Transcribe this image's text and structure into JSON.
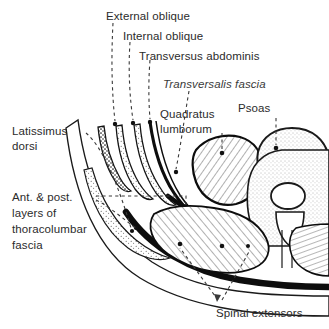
{
  "figure": {
    "type": "anatomical-cross-section-diagram",
    "background_color": "#ffffff",
    "ink_color": "#1a1a1a",
    "text_color": "#2b2b2b",
    "leader_line_style": "dashed",
    "width": 329,
    "height": 329
  },
  "labels": {
    "external_oblique": "External oblique",
    "internal_oblique": "Internal oblique",
    "transversus_abdominis": "Transversus abdominis",
    "transversalis_fascia": "Transversalis fascia",
    "quadratus_lumborum_line1": "Quadratus",
    "quadratus_lumborum_line2": "lumborum",
    "psoas": "Psoas",
    "latissimus_dorsi_line1": "Latissimus",
    "latissimus_dorsi_line2": "dorsi",
    "thoracolumbar_fascia_line1": "Ant. & post.",
    "thoracolumbar_fascia_line2": "layers of",
    "thoracolumbar_fascia_line3": "thoracolumbar",
    "thoracolumbar_fascia_line4": "fascia",
    "spinal_extensors": "Spinal extensors"
  },
  "structures": [
    {
      "name": "external-oblique",
      "texture": "dark-stipple",
      "region": "lateral-abdominal-wall-outer"
    },
    {
      "name": "internal-oblique",
      "texture": "light-stipple",
      "region": "lateral-abdominal-wall-middle"
    },
    {
      "name": "transversus-abdominis",
      "texture": "light-stipple",
      "region": "lateral-abdominal-wall-inner"
    },
    {
      "name": "transversalis-fascia",
      "texture": "solid-black-line",
      "region": "deep-to-transversus"
    },
    {
      "name": "quadratus-lumborum",
      "texture": "coarse-hatch",
      "region": "posterior-abdominal-wall"
    },
    {
      "name": "psoas-major",
      "texture": "fine-stipple",
      "region": "anterolateral-vertebral-body"
    },
    {
      "name": "vertebral-body",
      "texture": "fine-stipple",
      "region": "central"
    },
    {
      "name": "spinal-canal",
      "texture": "open-oval",
      "region": "central-posterior"
    },
    {
      "name": "spinous-process",
      "texture": "hatch",
      "region": "posterior-midline"
    },
    {
      "name": "spinal-extensors",
      "texture": "coarse-hatch",
      "region": "posterior-paraspinal"
    },
    {
      "name": "latissimus-dorsi",
      "texture": "light-stipple",
      "region": "posterolateral-superficial"
    },
    {
      "name": "thoracolumbar-fascia",
      "texture": "solid-black-band",
      "region": "posterior-investing-layer"
    }
  ]
}
